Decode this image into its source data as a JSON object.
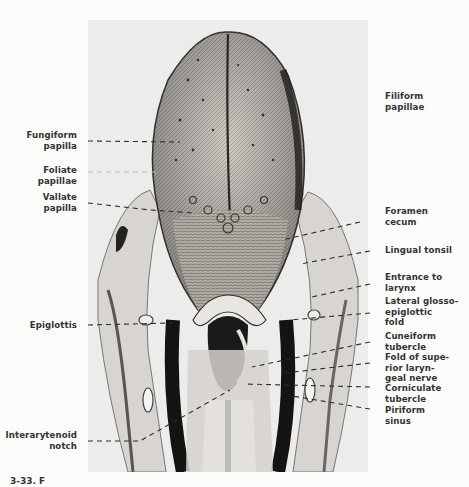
{
  "figure": {
    "caption_visible": "3-33. F"
  },
  "labels_left": [
    {
      "id": "fungiform",
      "lines": [
        "Fungiform",
        "papilla"
      ]
    },
    {
      "id": "foliate",
      "lines": [
        "Foliate",
        "papillae"
      ]
    },
    {
      "id": "vallate",
      "lines": [
        "Vallate",
        "papilla"
      ]
    },
    {
      "id": "epiglottis",
      "lines": [
        "Epiglottis"
      ]
    },
    {
      "id": "interarytenoid",
      "lines": [
        "Interarytenoid",
        "notch"
      ]
    }
  ],
  "labels_right": [
    {
      "id": "filiform",
      "lines": [
        "Filiform",
        "papillae"
      ]
    },
    {
      "id": "foramen",
      "lines": [
        "Foramen",
        "cecum"
      ]
    },
    {
      "id": "lingual-tonsil",
      "lines": [
        "Lingual tonsil"
      ]
    },
    {
      "id": "entrance",
      "lines": [
        "Entrance to",
        "larynx"
      ]
    },
    {
      "id": "lateral-fold",
      "lines": [
        "Lateral glosso-",
        "epiglottic",
        "fold"
      ]
    },
    {
      "id": "cuneiform",
      "lines": [
        "Cuneiform",
        "tubercle"
      ]
    },
    {
      "id": "fold-nerve",
      "lines": [
        "Fold of supe-",
        "rior laryn-",
        "geal nerve"
      ]
    },
    {
      "id": "corniculate",
      "lines": [
        "Corniculate",
        "tubercle"
      ]
    },
    {
      "id": "piriform",
      "lines": [
        "Piriform",
        "sinus"
      ]
    }
  ]
}
